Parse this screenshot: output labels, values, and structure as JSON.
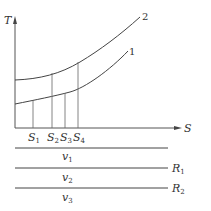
{
  "diagram": {
    "axes": {
      "y_label": "T",
      "x_label": "S"
    },
    "curves": [
      {
        "id": "1",
        "label": "1"
      },
      {
        "id": "2",
        "label": "2"
      }
    ],
    "s_marks": [
      {
        "label": "S",
        "sub": "1"
      },
      {
        "label": "S",
        "sub": "2"
      },
      {
        "label": "S",
        "sub": "3"
      },
      {
        "label": "S",
        "sub": "4"
      }
    ],
    "regions": [
      {
        "label": "v",
        "sub": "1"
      },
      {
        "label": "v",
        "sub": "2"
      },
      {
        "label": "v",
        "sub": "3"
      }
    ],
    "boundaries": [
      {
        "label": "R",
        "sub": "1"
      },
      {
        "label": "R",
        "sub": "2"
      }
    ],
    "colors": {
      "line": "#444444",
      "background": "#ffffff"
    }
  }
}
